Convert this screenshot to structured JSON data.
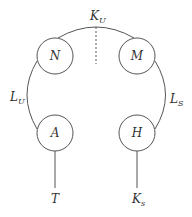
{
  "diagram": {
    "nodes": [
      {
        "id": "N",
        "label": "N",
        "cx": 55,
        "cy": 56,
        "r": 18
      },
      {
        "id": "M",
        "label": "M",
        "cx": 137,
        "cy": 56,
        "r": 18
      },
      {
        "id": "A",
        "label": "A",
        "cx": 55,
        "cy": 133,
        "r": 18
      },
      {
        "id": "H",
        "label": "H",
        "cx": 137,
        "cy": 133,
        "r": 18
      }
    ],
    "edge_labels": {
      "top": {
        "main": "K",
        "sub": "U"
      },
      "left": {
        "main": "L",
        "sub": "U"
      },
      "right": {
        "main": "L",
        "sub": "S"
      }
    },
    "terminals": {
      "left": {
        "main": "T",
        "sub": ""
      },
      "right": {
        "main": "K",
        "sub": "s"
      }
    },
    "colors": {
      "stroke": "#555555",
      "text": "#333333",
      "background": "#ffffff"
    }
  }
}
